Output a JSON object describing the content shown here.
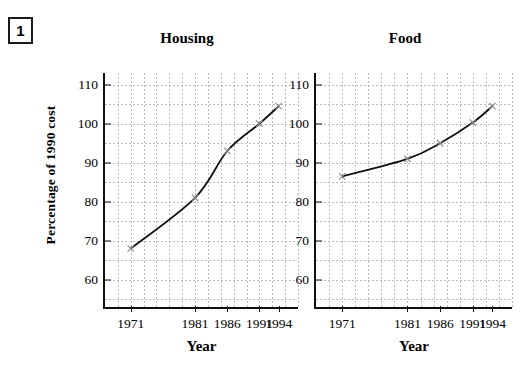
{
  "question_number": "1",
  "y_axis_caption": "Percentage of 1990 cost",
  "x_axis_caption": "Year",
  "colors": {
    "line": "#111111",
    "marker": "#8a8a8a",
    "grid": "#b9bcc4",
    "axis": "#111111",
    "background": "#ffffff"
  },
  "chart_data": [
    {
      "type": "line",
      "title": "Housing",
      "xlabel": "Year",
      "ylabel": "Percentage of 1990 cost",
      "categories": [
        "1971",
        "1981",
        "1986",
        "1991",
        "1994"
      ],
      "x": [
        1971,
        1981,
        1986,
        1991,
        1994
      ],
      "values": [
        68,
        81,
        93,
        100,
        104.5
      ],
      "ylim": [
        53,
        113
      ],
      "xlim": [
        1967,
        1997
      ],
      "yticks": [
        60,
        70,
        80,
        90,
        100,
        110
      ],
      "ytick_labels": [
        "60",
        "70",
        "80",
        "90",
        "100",
        "110"
      ],
      "xtick_labels": [
        "1971",
        "1981",
        "1986",
        "1991",
        "1994"
      ],
      "grid": true,
      "grid_style": "dotted",
      "legend": "none",
      "marker": "x"
    },
    {
      "type": "line",
      "title": "Food",
      "xlabel": "Year",
      "ylabel": "Percentage of 1990 cost",
      "categories": [
        "1971",
        "1981",
        "1986",
        "1991",
        "1994"
      ],
      "x": [
        1971,
        1981,
        1986,
        1991,
        1994
      ],
      "values": [
        86.5,
        91,
        95,
        100.3,
        104.5
      ],
      "ylim": [
        53,
        113
      ],
      "xlim": [
        1967,
        1997
      ],
      "yticks": [
        60,
        70,
        80,
        90,
        100,
        110
      ],
      "ytick_labels": [
        "60",
        "70",
        "80",
        "90",
        "100",
        "110"
      ],
      "xtick_labels": [
        "1971",
        "1981",
        "1986",
        "1991",
        "1994"
      ],
      "grid": true,
      "grid_style": "dotted",
      "legend": "none",
      "marker": "x"
    }
  ]
}
